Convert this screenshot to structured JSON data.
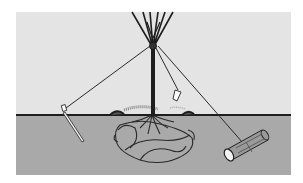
{
  "illustration": {
    "subject": "staked-tree-diagram",
    "colors": {
      "background": "#ffffff",
      "sky": "#e4e4e4",
      "ground": "#a9a9a9",
      "ink": "#222222",
      "log_fill": "#9a9a9a"
    },
    "elements": [
      {
        "name": "tree-trunk",
        "icon": "tree-icon"
      },
      {
        "name": "guy-wire-left",
        "icon": "wire-icon"
      },
      {
        "name": "guy-wire-center",
        "icon": "wire-icon"
      },
      {
        "name": "guy-wire-right",
        "icon": "wire-icon"
      },
      {
        "name": "stake-left",
        "icon": "stake-icon"
      },
      {
        "name": "stake-center",
        "icon": "stake-icon"
      },
      {
        "name": "log-anchor",
        "icon": "log-icon"
      },
      {
        "name": "root-ball",
        "icon": "roots-icon"
      },
      {
        "name": "soil-mound",
        "icon": "mound-icon"
      }
    ]
  }
}
